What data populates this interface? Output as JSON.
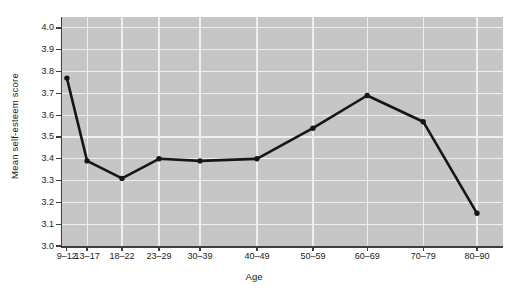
{
  "chart_data": {
    "type": "line",
    "title": "",
    "categories": [
      "9–12",
      "13–17",
      "18–22",
      "23–29",
      "30–39",
      "40–49",
      "50–59",
      "60–69",
      "70–79",
      "80–90"
    ],
    "values": [
      3.77,
      3.39,
      3.31,
      3.4,
      3.39,
      3.4,
      3.54,
      3.69,
      3.57,
      3.15
    ],
    "xlabel": "Age",
    "ylabel": "Mean self-esteem score",
    "ylim": [
      3.0,
      4.05
    ],
    "y_ticks": [
      "3.0",
      "3.1",
      "3.2",
      "3.3",
      "3.4",
      "3.5",
      "3.6",
      "3.7",
      "3.8",
      "3.9",
      "4.0"
    ],
    "x_positions_pct": [
      1.1,
      5.7,
      13.6,
      22.0,
      31.3,
      44.2,
      56.9,
      69.2,
      81.9,
      94.1
    ],
    "grid": "on",
    "legend": "none",
    "marker": "dot",
    "colors": {
      "line": "#161616",
      "plot_bg": "#c6c6c6",
      "grid": "#efefef",
      "axis": "#3d3d3d",
      "text": "#1b1b1b"
    }
  }
}
